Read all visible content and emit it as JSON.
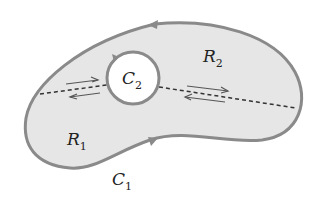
{
  "diagram": {
    "colors": {
      "fill": "#e6e6e6",
      "outline": "#8a8a8a",
      "hole": "#ffffff",
      "dash": "#333333",
      "arrow": "#555555"
    },
    "labels": {
      "c1": {
        "main": "C",
        "sub": "1"
      },
      "c2": {
        "main": "C",
        "sub": "2"
      },
      "r1": {
        "main": "R",
        "sub": "1"
      },
      "r2": {
        "main": "R",
        "sub": "2"
      }
    }
  }
}
